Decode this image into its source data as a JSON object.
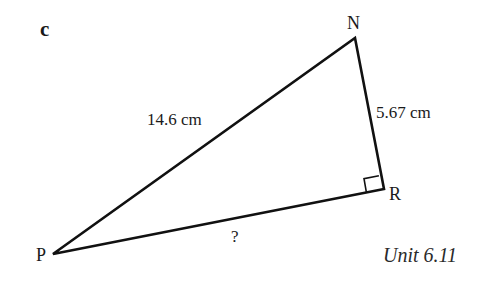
{
  "figure": {
    "part_label": "c",
    "unit_reference": "Unit 6.11",
    "line_color": "#111111",
    "vertices": {
      "P": {
        "label": "P",
        "x": 53,
        "y": 254
      },
      "N": {
        "label": "N",
        "x": 355,
        "y": 38
      },
      "R": {
        "label": "R",
        "x": 384,
        "y": 189
      }
    },
    "sides": {
      "PN": {
        "label": "14.6 cm",
        "role": "hypotenuse"
      },
      "NR": {
        "label": "5.67 cm"
      },
      "PR": {
        "label": "?",
        "role": "unknown"
      }
    },
    "right_angle_at": "R"
  }
}
